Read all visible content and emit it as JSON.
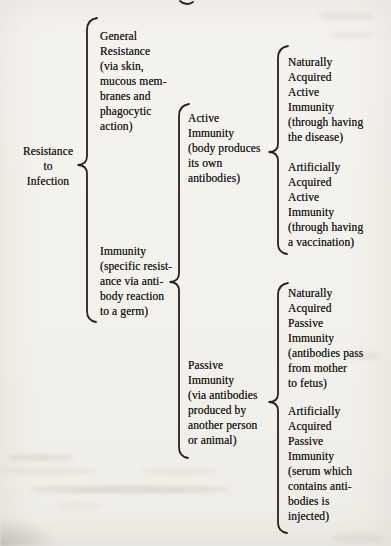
{
  "figure": {
    "type": "brace-map",
    "ink_color": "#26231e",
    "paper_color": "#f3f1eb"
  },
  "nodes": {
    "root": {
      "lines": [
        "Resistance",
        "to",
        "Infection"
      ],
      "children": [
        "general_resistance",
        "immunity"
      ]
    },
    "general_resistance": {
      "lines": [
        "General",
        "Resistance",
        "(via skin,",
        "mucous mem-",
        "branes and",
        "phagocytic",
        "action)"
      ],
      "children": []
    },
    "immunity": {
      "lines": [
        "Immunity",
        "(specific resist-",
        "ance via anti-",
        "body reaction",
        "to a germ)"
      ],
      "children": [
        "active_immunity",
        "passive_immunity"
      ]
    },
    "active_immunity": {
      "lines": [
        "Active",
        "Immunity",
        "(body produces",
        "its own",
        "antibodies)"
      ],
      "children": [
        "naturally_acquired_active_immunity",
        "artificially_acquired_active_immunity"
      ]
    },
    "passive_immunity": {
      "lines": [
        "Passive",
        "Immunity",
        "(via antibodies",
        "produced by",
        "another person",
        "or animal)"
      ],
      "children": [
        "naturally_acquired_passive_immunity",
        "artificially_acquired_passive_immunity"
      ]
    },
    "naturally_acquired_active_immunity": {
      "lines": [
        "Naturally",
        "Acquired",
        "Active",
        "Immunity",
        "(through having",
        "the disease)"
      ],
      "children": []
    },
    "artificially_acquired_active_immunity": {
      "lines": [
        "Artificially",
        "Acquired",
        "Active",
        "Immunity",
        "(through having",
        "a vaccination)"
      ],
      "children": []
    },
    "naturally_acquired_passive_immunity": {
      "lines": [
        "Naturally",
        "Acquired",
        "Passive",
        "Immunity",
        "(antibodies pass",
        "from mother",
        "to fetus)"
      ],
      "children": []
    },
    "artificially_acquired_passive_immunity": {
      "lines": [
        "Artificially",
        "Acquired",
        "Passive",
        "Immunity",
        "(serum which",
        "contains anti-",
        "bodies is",
        "injected)"
      ],
      "children": []
    }
  }
}
